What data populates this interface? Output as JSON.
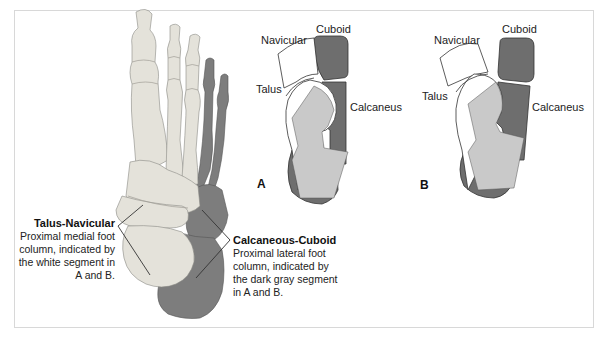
{
  "figure": {
    "colors": {
      "white_segment": "#ffffff",
      "light_gray_segment": "#c9c9c9",
      "dark_gray_segment": "#6e6e6e",
      "outline": "#333333",
      "bone_light": "#e2e0d8",
      "bone_dark": "#7a7a7a",
      "frame_border": "#d8d8d8"
    },
    "callouts": {
      "talus_navicular": {
        "title": "Talus-Navicular",
        "lines": [
          "Proximal medial foot",
          "column, indicated by",
          "the white segment in",
          "A and B."
        ]
      },
      "calcaneous_cuboid": {
        "title": "Calcaneous-Cuboid",
        "lines": [
          "Proximal lateral foot",
          "column, indicated by",
          "the dark gray segment",
          "in A and B."
        ]
      }
    },
    "panel_a": {
      "letter": "A",
      "labels": {
        "navicular": "Navicular",
        "cuboid": "Cuboid",
        "talus": "Talus",
        "calcaneus": "Calcaneus"
      }
    },
    "panel_b": {
      "letter": "B",
      "labels": {
        "navicular": "Navicular",
        "cuboid": "Cuboid",
        "talus": "Talus",
        "calcaneus": "Calcaneus"
      }
    }
  }
}
